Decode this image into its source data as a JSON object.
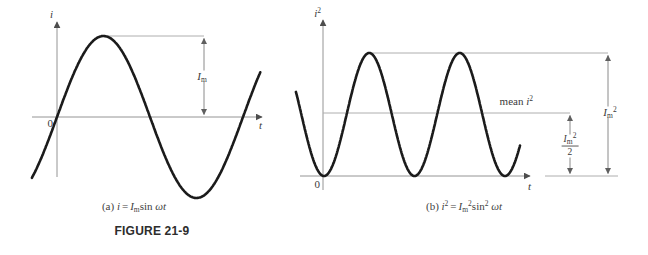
{
  "figure": {
    "label": "FIGURE 21-9"
  },
  "colors": {
    "curve": "#1b1b1b",
    "axis": "#949494",
    "ref_line": "#aeaeae",
    "text": "#3a3a3a"
  },
  "chart_data": [
    {
      "id": "a",
      "type": "line",
      "equation": "i = Im sin(ωt)",
      "x_axis": {
        "label": "t"
      },
      "y_axis": {
        "label": "i",
        "label_sup": ""
      },
      "origin_label": "0",
      "amplitude_annotation": {
        "base": "I",
        "sub": "m",
        "sup": ""
      },
      "caption": {
        "tag": "(a)",
        "lhs": "i",
        "lhs_sup": "",
        "eq": "=",
        "coeff_base": "I",
        "coeff_sub": "m",
        "coeff_sup": "",
        "fn": "sin",
        "fn_sup": "",
        "arg": "ωt"
      },
      "plot": {
        "wave": "sin",
        "amplitude": 1,
        "start_periods": -0.135,
        "end_periods": 1.097,
        "zero_crossings_wt": [
          "0",
          "π",
          "2π"
        ],
        "peak_value": "Im",
        "trough_value": "-Im"
      }
    },
    {
      "id": "b",
      "type": "line",
      "equation": "i² = Im² sin²(ωt)",
      "x_axis": {
        "label": "t"
      },
      "y_axis": {
        "label": "i",
        "label_sup": "2"
      },
      "origin_label": "0",
      "mean_line": {
        "text": "mean",
        "var": "i",
        "sup": "2",
        "level": 0.5
      },
      "peak_annotation": {
        "base": "I",
        "sub": "m",
        "sup": "2"
      },
      "half_annotation": {
        "num_base": "I",
        "num_sub": "m",
        "num_sup": "2",
        "den": "2"
      },
      "caption": {
        "tag": "(b)",
        "lhs": "i",
        "lhs_sup": "2",
        "eq": "=",
        "coeff_base": "I",
        "coeff_sub": "m",
        "coeff_sup": "2",
        "fn": "sin",
        "fn_sup": "2",
        "arg": "ωt"
      },
      "plot": {
        "wave": "sin_squared",
        "peak": 1,
        "mean": 0.5,
        "start_humps": -0.31,
        "end_humps": 2.17,
        "zeros_wt": [
          "0",
          "π",
          "2π"
        ],
        "peak_value": "Im²",
        "mean_value": "Im²/2"
      }
    }
  ]
}
